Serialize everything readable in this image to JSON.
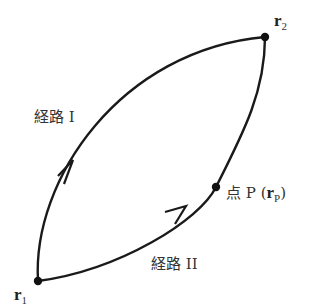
{
  "diagram": {
    "points": {
      "r1": {
        "label": "r",
        "subscript": "1",
        "x": 38,
        "y": 281
      },
      "r2": {
        "label": "r",
        "subscript": "2",
        "x": 265,
        "y": 37
      },
      "P": {
        "prefix": "点 P",
        "open": "(",
        "label": "r",
        "subscript": "P",
        "close": ")",
        "x": 216,
        "y": 187
      }
    },
    "paths": {
      "path1": {
        "label": "経路 I"
      },
      "path2": {
        "label": "経路 II"
      }
    },
    "colors": {
      "stroke": "#1a1a1a",
      "text": "#333333"
    }
  }
}
